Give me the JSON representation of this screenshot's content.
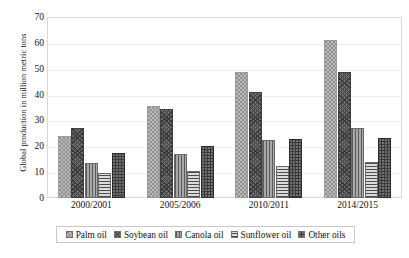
{
  "chart_data": {
    "type": "bar",
    "title": "",
    "xlabel": "",
    "ylabel": "Global production in million metric tons",
    "categories": [
      "2000/2001",
      "2005/2006",
      "2010/2011",
      "2014/2015"
    ],
    "ylim": [
      0,
      70
    ],
    "ytick_labels": [
      "0",
      "10",
      "20",
      "30",
      "40",
      "50",
      "60",
      "70"
    ],
    "ytick_values": [
      0,
      10,
      20,
      30,
      40,
      50,
      60,
      70
    ],
    "grid": true,
    "legend_position": "bottom",
    "series": [
      {
        "name": "Palm oil",
        "values": [
          24,
          35.5,
          48.7,
          61
        ],
        "icon": "legend-swatch-dotted"
      },
      {
        "name": "Soybean oil",
        "values": [
          27,
          34.3,
          41,
          48.7
        ],
        "icon": "legend-swatch-crosshatch"
      },
      {
        "name": "Canola oil",
        "values": [
          13.4,
          17,
          22.6,
          27
        ],
        "icon": "legend-swatch-vertical"
      },
      {
        "name": "Sunflower oil",
        "values": [
          9.5,
          10.5,
          12.2,
          14
        ],
        "icon": "legend-swatch-horizontal"
      },
      {
        "name": "Other oils",
        "values": [
          17.5,
          20,
          22.8,
          23.3
        ],
        "icon": "legend-swatch-solid"
      }
    ]
  },
  "colors": {
    "palm_oil": "#bcbcbc",
    "soybean_oil": "#6d6d6d",
    "canola_oil": "#a8a8a8",
    "sunflower_oil": "#dcdcdc",
    "other_oils": "#3c3c3c",
    "frame": "#d9d9d9",
    "gridline": "#ececec",
    "text": "#111111",
    "background": "#ffffff"
  }
}
